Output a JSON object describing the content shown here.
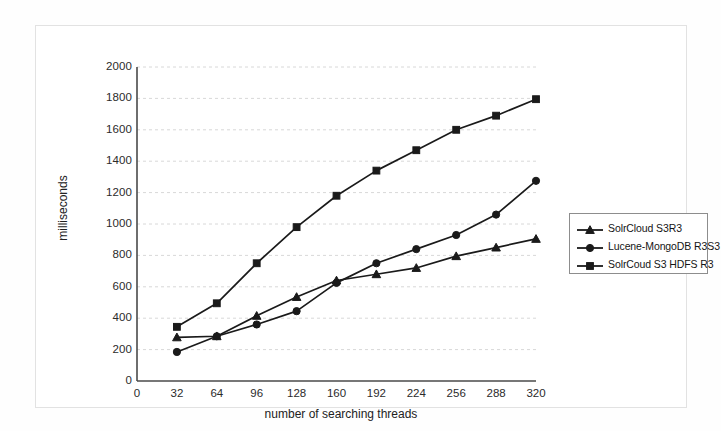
{
  "chart_data": {
    "type": "line",
    "title": "",
    "xlabel": "number of searching threads",
    "ylabel": "milliseconds",
    "xlim": [
      0,
      320
    ],
    "ylim": [
      0,
      2000
    ],
    "xticks": [
      "0",
      "32",
      "64",
      "96",
      "128",
      "160",
      "192",
      "224",
      "256",
      "288",
      "320"
    ],
    "yticks": [
      "0",
      "200",
      "400",
      "600",
      "800",
      "1000",
      "1200",
      "1400",
      "1600",
      "1800",
      "2000"
    ],
    "grid": "horizontal-dotted",
    "legend_position": "right",
    "x": [
      32,
      64,
      96,
      128,
      160,
      192,
      224,
      256,
      288,
      320
    ],
    "series": [
      {
        "name": "SolrCloud S3R3",
        "marker": "triangle",
        "values": [
          278,
          285,
          415,
          535,
          640,
          680,
          720,
          795,
          850,
          905
        ]
      },
      {
        "name": "Lucene-MongoDB R3S3",
        "marker": "circle",
        "values": [
          185,
          285,
          360,
          445,
          625,
          750,
          840,
          930,
          1060,
          1275
        ]
      },
      {
        "name": "SolrCoud S3 HDFS R3",
        "marker": "square",
        "values": [
          345,
          495,
          750,
          980,
          1180,
          1340,
          1470,
          1600,
          1690,
          1795
        ]
      }
    ]
  },
  "legend": {
    "items": [
      {
        "label": "SolrCloud S3R3",
        "marker": "triangle-marker"
      },
      {
        "label": "Lucene-MongoDB R3S3",
        "marker": "circle-marker"
      },
      {
        "label": "SolrCoud S3 HDFS R3",
        "marker": "square-marker"
      }
    ]
  },
  "colors": {
    "series_line": "#1a1a1a",
    "grid": "#d8d8d8",
    "axis": "#4a4a4a",
    "frame": "#e2e2e2"
  }
}
